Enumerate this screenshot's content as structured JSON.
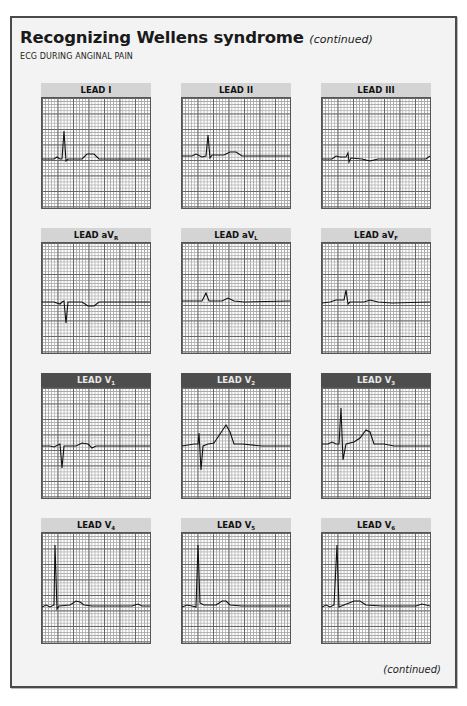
{
  "header": {
    "title": "Recognizing Wellens syndrome",
    "title_suffix": "(continued)",
    "subtitle": "ECG DURING ANGINAL PAIN"
  },
  "footer": {
    "continued_label": "(continued)"
  },
  "leads": [
    {
      "id": "I",
      "label": "LEAD I",
      "sub": "",
      "header_style": "light",
      "waveform": "upright R, small upright T"
    },
    {
      "id": "II",
      "label": "LEAD II",
      "sub": "",
      "header_style": "light",
      "waveform": "upright R, small upright T"
    },
    {
      "id": "III",
      "label": "LEAD III",
      "sub": "",
      "header_style": "light",
      "waveform": "low-amplitude, small notch, flat T"
    },
    {
      "id": "aVR",
      "label": "LEAD aV",
      "sub": "R",
      "header_style": "light",
      "waveform": "negative QRS, inverted T"
    },
    {
      "id": "aVL",
      "label": "LEAD aV",
      "sub": "L",
      "header_style": "light",
      "waveform": "small upright R, small T"
    },
    {
      "id": "aVF",
      "label": "LEAD aV",
      "sub": "F",
      "header_style": "light",
      "waveform": "upright R, small T"
    },
    {
      "id": "V1",
      "label": "LEAD V",
      "sub": "1",
      "header_style": "dark",
      "waveform": "deep S, small upright T"
    },
    {
      "id": "V2",
      "label": "LEAD V",
      "sub": "2",
      "header_style": "dark",
      "waveform": "RS complex, tall upright T"
    },
    {
      "id": "V3",
      "label": "LEAD V",
      "sub": "3",
      "header_style": "dark",
      "waveform": "tall R, deep S, tall upright T"
    },
    {
      "id": "V4",
      "label": "LEAD V",
      "sub": "4",
      "header_style": "light",
      "waveform": "tall R, upright T"
    },
    {
      "id": "V5",
      "label": "LEAD V",
      "sub": "5",
      "header_style": "light",
      "waveform": "tall R, upright T"
    },
    {
      "id": "V6",
      "label": "LEAD V",
      "sub": "6",
      "header_style": "light",
      "waveform": "tall R, upright T"
    }
  ],
  "colors": {
    "frame_border": "#4a4a4a",
    "frame_bg": "#f3f3f3",
    "header_light": "#d4d4d4",
    "header_dark": "#4d4d4d",
    "trace": "#111111"
  }
}
